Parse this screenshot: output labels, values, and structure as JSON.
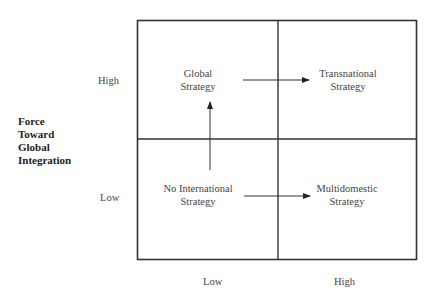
{
  "y_axis": {
    "title_lines": [
      "Force",
      "Toward",
      "Global",
      "Integration"
    ],
    "high_label": "High",
    "low_label": "Low"
  },
  "x_axis": {
    "low_label": "Low",
    "high_label": "High"
  },
  "quadrants": {
    "top_left": [
      "Global",
      "Strategy"
    ],
    "top_right": [
      "Transnational",
      "Strategy"
    ],
    "bottom_left": [
      "No International",
      "Strategy"
    ],
    "bottom_right": [
      "Multidomestic",
      "Strategy"
    ]
  },
  "arrows": [
    {
      "from": "No International Strategy",
      "to": "Global Strategy",
      "direction": "up"
    },
    {
      "from": "Global Strategy",
      "to": "Transnational Strategy",
      "direction": "right"
    },
    {
      "from": "No International Strategy",
      "to": "Multidomestic Strategy",
      "direction": "right"
    }
  ],
  "colors": {
    "line": "#333333",
    "text": "#444444"
  }
}
